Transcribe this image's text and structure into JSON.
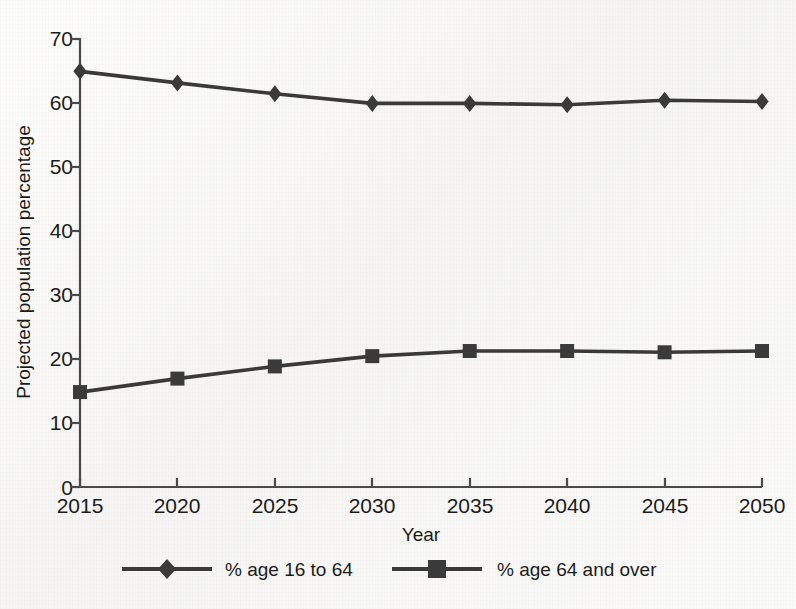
{
  "chart_data": {
    "type": "line",
    "title": "",
    "subtitle": "",
    "xlabel": "Year",
    "ylabel": "Projected population percentage",
    "categories": [
      2015,
      2020,
      2025,
      2030,
      2035,
      2040,
      2045,
      2050
    ],
    "x_tick_labels": [
      "2015",
      "2020",
      "2025",
      "2030",
      "2035",
      "2040",
      "2045",
      "2050"
    ],
    "y_tick_labels": [
      "0",
      "10",
      "20",
      "30",
      "40",
      "50",
      "60",
      "70"
    ],
    "y_ticks": [
      0,
      10,
      20,
      30,
      40,
      50,
      60,
      70
    ],
    "xlim": [
      2015,
      2050
    ],
    "ylim": [
      0,
      70
    ],
    "grid": false,
    "legend_position": "bottom",
    "series": [
      {
        "name": "% age 16 to 64",
        "marker": "diamond",
        "color": "#3a3a3a",
        "values": [
          64.8,
          63.0,
          61.3,
          59.8,
          59.8,
          59.6,
          60.3,
          60.1
        ]
      },
      {
        "name": "% age 64 and over",
        "marker": "square",
        "color": "#3a3a3a",
        "values": [
          14.8,
          16.9,
          18.8,
          20.4,
          21.2,
          21.2,
          21.0,
          21.2
        ]
      }
    ]
  },
  "axes": {
    "y_axis_title": "Projected population percentage",
    "x_axis_title": "Year"
  },
  "legend": {
    "items": [
      {
        "label": "% age 16 to 64",
        "marker": "diamond"
      },
      {
        "label": "% age 64 and over",
        "marker": "square"
      }
    ]
  },
  "colors": {
    "line": "#3a3a3a",
    "axis": "#4a4a4a",
    "text": "#1b1b1b",
    "background": "#fbfbfa"
  }
}
